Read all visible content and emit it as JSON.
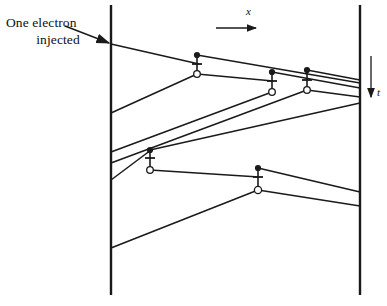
{
  "figure": {
    "background_color": "#ffffff",
    "line_color": "#1a1a1a",
    "width": 387,
    "height": 306
  },
  "annotation": {
    "label_line_1": "One electron",
    "label_line_2": "injected",
    "pointer_arrow": "arrow pointing down-right to left boundary"
  },
  "axes": {
    "x_axis": {
      "label": "x",
      "direction": "right",
      "arrow_from": [
        216,
        28
      ],
      "arrow_to": [
        258,
        28
      ],
      "label_pos": [
        246,
        12
      ]
    },
    "t_axis": {
      "label": "t",
      "direction": "down",
      "arrow_from": [
        371,
        56
      ],
      "arrow_to": [
        371,
        99
      ],
      "label_pos": [
        378,
        92
      ]
    }
  },
  "boundaries": {
    "left_wall": {
      "x": 111,
      "y_top": 5,
      "y_bottom": 295
    },
    "right_wall": {
      "x": 360,
      "y_top": 5,
      "y_bottom": 295
    }
  },
  "vertices": [
    {
      "name": "vertex-1",
      "x": 197,
      "dot_y": 55,
      "cross_y": 64,
      "circle_y": 74
    },
    {
      "name": "vertex-2",
      "x": 272,
      "dot_y": 72,
      "cross_y": 81,
      "circle_y": 92
    },
    {
      "name": "vertex-3",
      "x": 307,
      "dot_y": 70,
      "cross_y": 80,
      "circle_y": 90
    },
    {
      "name": "vertex-4",
      "x": 150,
      "dot_y": 150,
      "cross_y": 158,
      "circle_y": 170
    },
    {
      "name": "vertex-5",
      "x": 258,
      "dot_y": 168,
      "cross_y": 177,
      "circle_y": 190
    }
  ],
  "worldlines": [
    {
      "name": "injected-electron",
      "from": [
        111,
        44
      ],
      "to": [
        197,
        64
      ]
    },
    {
      "name": "line-v1-dot-to-right",
      "from": [
        197,
        55
      ],
      "to": [
        360,
        83
      ]
    },
    {
      "name": "line-v1-circle-to-left",
      "from": [
        197,
        74
      ],
      "to": [
        111,
        113
      ]
    },
    {
      "name": "line-v1-circle-to-v2",
      "from": [
        197,
        74
      ],
      "to": [
        272,
        81
      ]
    },
    {
      "name": "line-v2-dot-to-right",
      "from": [
        272,
        72
      ],
      "to": [
        360,
        88
      ]
    },
    {
      "name": "line-v2-circle-down-left",
      "from": [
        272,
        92
      ],
      "to": [
        111,
        152
      ]
    },
    {
      "name": "line-v3-dot-to-right",
      "from": [
        307,
        70
      ],
      "to": [
        360,
        80
      ]
    },
    {
      "name": "line-v3-circle-to-right",
      "from": [
        307,
        90
      ],
      "to": [
        360,
        97
      ]
    },
    {
      "name": "line-v3-circle-down-left",
      "from": [
        307,
        90
      ],
      "to": [
        111,
        163
      ]
    },
    {
      "name": "line-left-to-v4-dot",
      "from": [
        111,
        180
      ],
      "to": [
        150,
        150
      ]
    },
    {
      "name": "line-v4-dot-to-right",
      "from": [
        150,
        150
      ],
      "to": [
        360,
        103
      ]
    },
    {
      "name": "line-v4-circle-to-v5",
      "from": [
        150,
        170
      ],
      "to": [
        258,
        177
      ]
    },
    {
      "name": "line-v5-dot-to-right",
      "from": [
        258,
        168
      ],
      "to": [
        360,
        192
      ]
    },
    {
      "name": "line-v5-circle-to-right",
      "from": [
        258,
        190
      ],
      "to": [
        360,
        206
      ]
    },
    {
      "name": "line-v5-circle-down-left",
      "from": [
        258,
        190
      ],
      "to": [
        111,
        248
      ]
    }
  ],
  "legend": {
    "filled_dot": "electron creation point",
    "open_circle": "hole / annihilation point",
    "cross": "interaction crossing mark"
  }
}
